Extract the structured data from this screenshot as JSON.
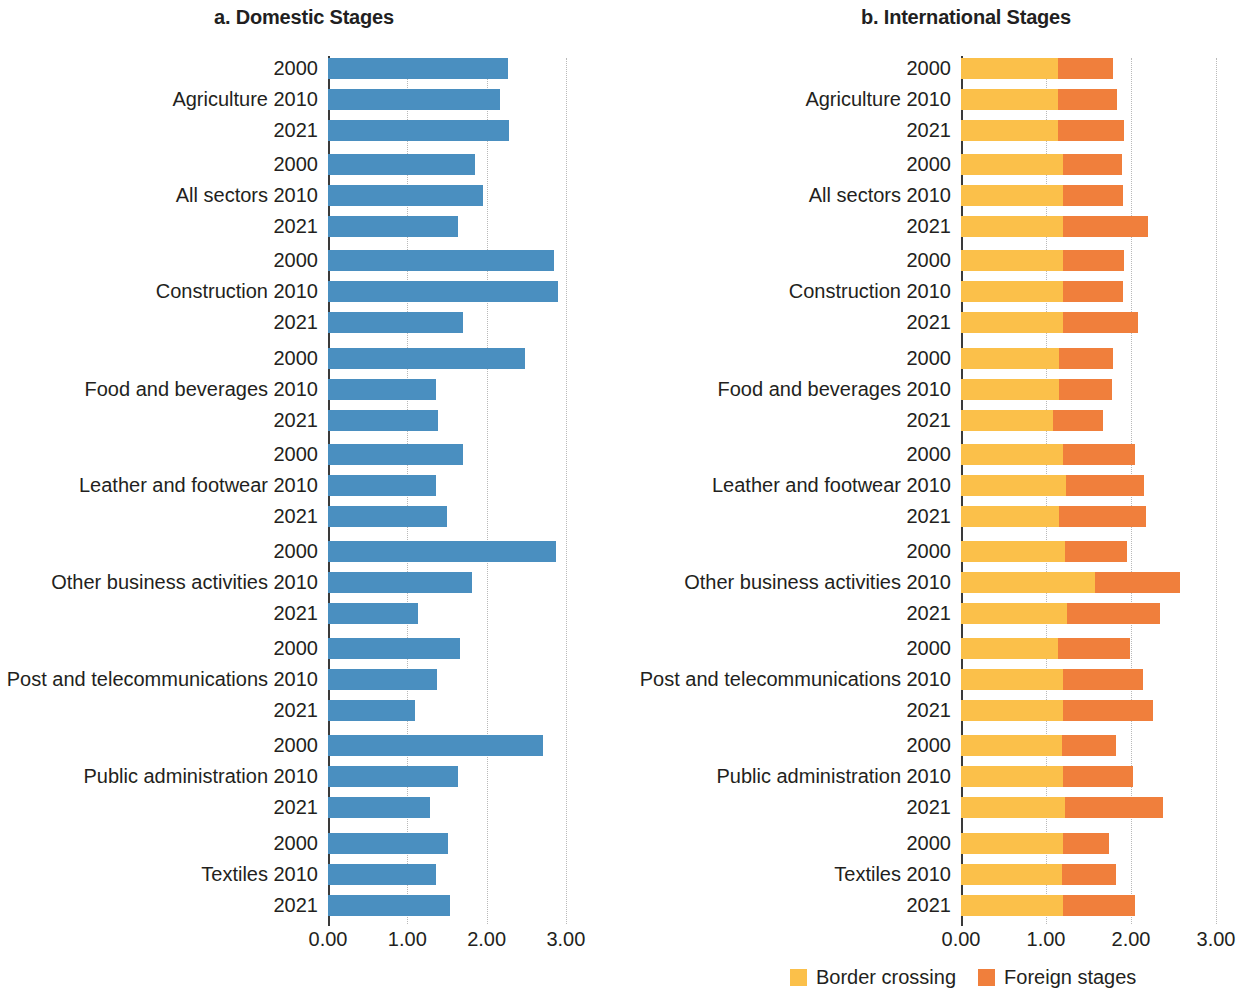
{
  "figure": {
    "panels": [
      {
        "id": "domestic",
        "title": "a. Domestic Stages"
      },
      {
        "id": "international",
        "title": "b. International Stages"
      }
    ],
    "legend": [
      {
        "key": "border_crossing",
        "label": "Border crossing",
        "color": "#fbc04a"
      },
      {
        "key": "foreign_stages",
        "label": "Foreign stages",
        "color": "#f07f3c"
      }
    ]
  },
  "chart_data": [
    {
      "type": "bar",
      "orientation": "horizontal",
      "title": "a. Domestic Stages",
      "xlabel": "",
      "ylabel": "",
      "xlim": [
        0,
        3.2
      ],
      "xticks": [
        "0.00",
        "1.00",
        "2.00",
        "3.00"
      ],
      "xtick_values": [
        0,
        1,
        2,
        3
      ],
      "grid": true,
      "legend_position": "none",
      "series": [
        {
          "name": "Domestic stages",
          "color": "#4a8fc0"
        }
      ],
      "categories": [
        "Agriculture",
        "All sectors",
        "Construction",
        "Food and beverages",
        "Leather and footwear",
        "Other business activities",
        "Post and telecommunications",
        "Public administration",
        "Textiles"
      ],
      "years": [
        "2000",
        "2010",
        "2021"
      ],
      "values": [
        {
          "category": "Agriculture",
          "2000": 2.27,
          "2010": 2.17,
          "2021": 2.28
        },
        {
          "category": "All sectors",
          "2000": 1.86,
          "2010": 1.95,
          "2021": 1.64
        },
        {
          "category": "Construction",
          "2000": 2.85,
          "2010": 2.9,
          "2021": 1.7
        },
        {
          "category": "Food and beverages",
          "2000": 2.48,
          "2010": 1.36,
          "2021": 1.39
        },
        {
          "category": "Leather and footwear",
          "2000": 1.7,
          "2010": 1.36,
          "2021": 1.5
        },
        {
          "category": "Other business activities",
          "2000": 2.87,
          "2010": 1.81,
          "2021": 1.13
        },
        {
          "category": "Post and telecommunications",
          "2000": 1.66,
          "2010": 1.37,
          "2021": 1.1
        },
        {
          "category": "Public administration",
          "2000": 2.71,
          "2010": 1.64,
          "2021": 1.28
        },
        {
          "category": "Textiles",
          "2000": 1.51,
          "2010": 1.36,
          "2021": 1.54
        }
      ]
    },
    {
      "type": "bar",
      "orientation": "horizontal",
      "stacked": true,
      "title": "b. International Stages",
      "xlabel": "",
      "ylabel": "",
      "xlim": [
        0,
        3.0
      ],
      "xticks": [
        "0.00",
        "1.00",
        "2.00",
        "3.00"
      ],
      "xtick_values": [
        0,
        1,
        2,
        3
      ],
      "grid": true,
      "legend_position": "bottom",
      "series": [
        {
          "name": "Border crossing",
          "color": "#fbc04a"
        },
        {
          "name": "Foreign stages",
          "color": "#f07f3c"
        }
      ],
      "categories": [
        "Agriculture",
        "All sectors",
        "Construction",
        "Food and beverages",
        "Leather and footwear",
        "Other business activities",
        "Post and telecommunications",
        "Public administration",
        "Textiles"
      ],
      "years": [
        "2000",
        "2010",
        "2021"
      ],
      "values": [
        {
          "category": "Agriculture",
          "2000": {
            "border": 1.14,
            "foreign": 0.65,
            "total": 1.79
          },
          "2010": {
            "border": 1.14,
            "foreign": 0.7,
            "total": 1.84
          },
          "2021": {
            "border": 1.14,
            "foreign": 0.78,
            "total": 1.92
          }
        },
        {
          "category": "All sectors",
          "2000": {
            "border": 1.2,
            "foreign": 0.69,
            "total": 1.89
          },
          "2010": {
            "border": 1.2,
            "foreign": 0.7,
            "total": 1.9
          },
          "2021": {
            "border": 1.2,
            "foreign": 1.0,
            "total": 2.2
          }
        },
        {
          "category": "Construction",
          "2000": {
            "border": 1.2,
            "foreign": 0.72,
            "total": 1.92
          },
          "2010": {
            "border": 1.2,
            "foreign": 0.71,
            "total": 1.91
          },
          "2021": {
            "border": 1.2,
            "foreign": 0.88,
            "total": 2.08
          }
        },
        {
          "category": "Food and beverages",
          "2000": {
            "border": 1.15,
            "foreign": 0.64,
            "total": 1.79
          },
          "2010": {
            "border": 1.15,
            "foreign": 0.63,
            "total": 1.78
          },
          "2021": {
            "border": 1.08,
            "foreign": 0.59,
            "total": 1.67
          }
        },
        {
          "category": "Leather and footwear",
          "2000": {
            "border": 1.2,
            "foreign": 0.85,
            "total": 2.05
          },
          "2010": {
            "border": 1.24,
            "foreign": 0.91,
            "total": 2.15
          },
          "2021": {
            "border": 1.15,
            "foreign": 1.03,
            "total": 2.18
          }
        },
        {
          "category": "Other business activities",
          "2000": {
            "border": 1.22,
            "foreign": 0.73,
            "total": 1.95
          },
          "2010": {
            "border": 1.58,
            "foreign": 1.0,
            "total": 2.58
          },
          "2021": {
            "border": 1.25,
            "foreign": 1.09,
            "total": 2.34
          }
        },
        {
          "category": "Post and telecommunications",
          "2000": {
            "border": 1.14,
            "foreign": 0.85,
            "total": 1.99
          },
          "2010": {
            "border": 1.2,
            "foreign": 0.94,
            "total": 2.14
          },
          "2021": {
            "border": 1.2,
            "foreign": 1.06,
            "total": 2.26
          }
        },
        {
          "category": "Public administration",
          "2000": {
            "border": 1.19,
            "foreign": 0.63,
            "total": 1.82
          },
          "2010": {
            "border": 1.2,
            "foreign": 0.82,
            "total": 2.02
          },
          "2021": {
            "border": 1.22,
            "foreign": 1.16,
            "total": 2.38
          }
        },
        {
          "category": "Textiles",
          "2000": {
            "border": 1.2,
            "foreign": 0.54,
            "total": 1.74
          },
          "2010": {
            "border": 1.19,
            "foreign": 0.63,
            "total": 1.82
          },
          "2021": {
            "border": 1.2,
            "foreign": 0.85,
            "total": 2.05
          }
        }
      ]
    }
  ]
}
